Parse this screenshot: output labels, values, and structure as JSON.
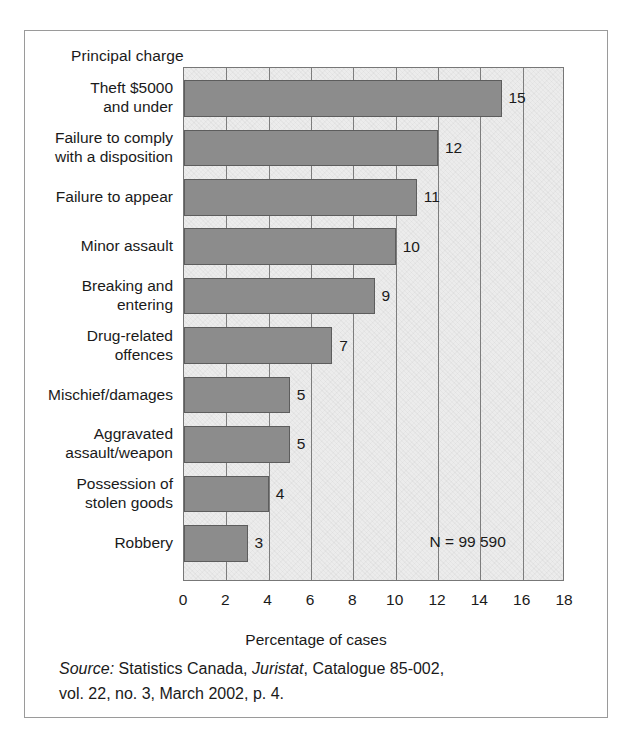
{
  "figure": {
    "y_axis_title": "Principal charge",
    "x_axis_title": "Percentage of cases",
    "n_annotation": "N = 99 590",
    "source": {
      "label": "Source:",
      "line1_rest_a": " Statistics Canada, ",
      "publication": "Juristat",
      "line1_rest_b": ", Catalogue 85-002,",
      "line2": "vol. 22, no. 3, March 2002, p. 4."
    },
    "colors": {
      "bar_fill": "#8c8c8c",
      "bar_edge": "#5d5d5d",
      "plot_background": "#ececec",
      "grid": "#7d7d7d",
      "frame": "#9a9a9a",
      "text": "#1a1a1a"
    }
  },
  "chart_data": {
    "type": "bar",
    "orientation": "horizontal",
    "title": "",
    "xlabel": "Percentage of cases",
    "ylabel": "Principal charge",
    "xlim": [
      0,
      18
    ],
    "xticks": [
      0,
      2,
      4,
      6,
      8,
      10,
      12,
      14,
      16,
      18
    ],
    "grid": true,
    "grid_axis": "x",
    "legend": false,
    "annotations": [
      "N = 99 590"
    ],
    "categories": [
      "Theft $5000\nand under",
      "Failure to comply\nwith a disposition",
      "Failure to appear",
      "Minor assault",
      "Breaking and\nentering",
      "Drug-related\noffences",
      "Mischief/damages",
      "Aggravated\nassault/weapon",
      "Possession of\nstolen goods",
      "Robbery"
    ],
    "values": [
      15,
      12,
      11,
      10,
      9,
      7,
      5,
      5,
      4,
      3
    ],
    "data_labels": [
      "15",
      "12",
      "11",
      "10",
      "9",
      "7",
      "5",
      "5",
      "4",
      "3"
    ]
  }
}
